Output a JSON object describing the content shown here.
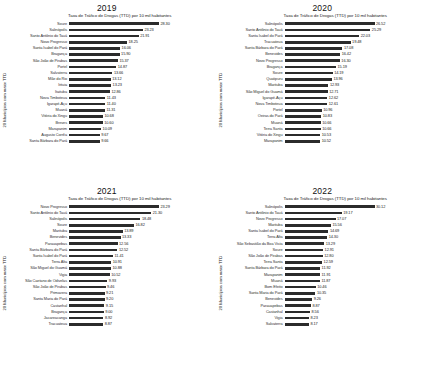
{
  "figure": {
    "axis_title": "Taxa de Tráfico de Drogas (TTD) por 10 mil habitantes",
    "y_axis_label": "20 Municípios com maior TTD",
    "bar_color": "#2b2b2b"
  },
  "chart_data": [
    {
      "type": "bar",
      "title": "2019",
      "xlabel": "Taxa de Tráfico de Drogas (TTD) por 10 mil habitantes",
      "ylabel": "20 Municípios com maior TTD",
      "orientation": "horizontal",
      "xlim": [
        0,
        28.3
      ],
      "grid": false,
      "legend": "none",
      "categories": [
        "Soure",
        "Salinópolis",
        "Santo Antônio do Tauá",
        "Novo Progresso",
        "Santa Isabel do Pará",
        "Bragança",
        "São João de Pirabas",
        "Portel",
        "Salvaterra",
        "Mãe do Rio",
        "Irituia",
        "Itaituba",
        "Nova Timboteua",
        "Igarapé-Açu",
        "Muaná",
        "Vitória do Xingu",
        "Breves",
        "Marapanim",
        "Augusto Corrêa",
        "Santa Bárbara do Pará"
      ],
      "values": [
        28.3,
        23.23,
        21.91,
        18.25,
        16.06,
        15.9,
        15.37,
        14.87,
        13.66,
        13.12,
        13.23,
        12.86,
        11.43,
        11.4,
        11.31,
        10.68,
        10.6,
        10.09,
        9.67,
        9.66
      ]
    },
    {
      "type": "bar",
      "title": "2020",
      "xlabel": "Taxa de Tráfico de Drogas (TTD) por 10 mil habitantes",
      "ylabel": "20 Municípios com maior TTD",
      "orientation": "horizontal",
      "xlim": [
        0,
        26.52
      ],
      "grid": false,
      "legend": "none",
      "categories": [
        "Salinópolis",
        "Santo Antônio do Tauá",
        "Santa Isabel do Pará",
        "Tracuateua",
        "Santa Bárbara do Pará",
        "Benevides",
        "Novo Progresso",
        "Bragança",
        "Soure",
        "Quatipuru",
        "Marituba",
        "São Miguel do Guamá",
        "Igarapé-Açu",
        "Nova Timboteua",
        "Portel",
        "Oeiras do Pará",
        "Muaná",
        "Terra Santa",
        "Vitória do Xingu",
        "Marapanim"
      ],
      "values": [
        26.52,
        25.29,
        22.03,
        19.48,
        17.08,
        16.42,
        16.3,
        15.19,
        14.19,
        13.96,
        12.93,
        12.71,
        12.62,
        12.61,
        10.96,
        10.83,
        10.66,
        10.66,
        10.53,
        10.52
      ]
    },
    {
      "type": "bar",
      "title": "2021",
      "xlabel": "Taxa de Tráfico de Drogas (TTD) por 10 mil habitantes",
      "ylabel": "20 Municípios com maior TTD",
      "orientation": "horizontal",
      "xlim": [
        0,
        23.29
      ],
      "grid": false,
      "legend": "none",
      "categories": [
        "Novo Progresso",
        "Santo Antônio do Tauá",
        "Salinópolis",
        "Soure",
        "Marituba",
        "Benevides",
        "Parauapebas",
        "Santa Bárbara do Pará",
        "Santa Isabel do Pará",
        "Terra Alta",
        "São Miguel do Guamá",
        "Vigia",
        "São Caetano de Odivelas",
        "São João de Pirabas",
        "Primavera",
        "Santa Maria do Pará",
        "Castanhal",
        "Bragança",
        "Jacareacanga",
        "Tracuateua"
      ],
      "values": [
        23.29,
        21.3,
        18.48,
        16.82,
        13.89,
        13.33,
        12.56,
        12.52,
        11.41,
        10.91,
        10.88,
        10.52,
        9.93,
        9.46,
        9.21,
        9.2,
        9.15,
        9.0,
        8.92,
        8.87
      ]
    },
    {
      "type": "bar",
      "title": "2022",
      "xlabel": "Taxa de Tráfico de Drogas (TTD) por 10 mil habitantes",
      "ylabel": "20 Municípios com maior TTD",
      "orientation": "horizontal",
      "xlim": [
        0,
        30.12
      ],
      "grid": false,
      "legend": "none",
      "categories": [
        "Salinópolis",
        "Santo Antônio do Tauá",
        "Novo Progresso",
        "Marituba",
        "Santa Isabel do Pará",
        "Terra Alta",
        "São Sebastião da Boa Vista",
        "Soure",
        "São João de Pirabas",
        "Terra Santa",
        "Santa Bárbara do Pará",
        "Marapanim",
        "Muaná",
        "Bom Efeito",
        "Santa Maria do Pará",
        "Benevides",
        "Parauapebas",
        "Castanhal",
        "Vigia",
        "Salvaterra"
      ],
      "values": [
        30.12,
        19.17,
        17.07,
        15.56,
        14.69,
        14.3,
        13.29,
        12.91,
        12.8,
        12.59,
        11.92,
        11.91,
        11.87,
        10.46,
        10.35,
        9.26,
        8.87,
        8.56,
        8.23,
        8.17
      ]
    }
  ]
}
